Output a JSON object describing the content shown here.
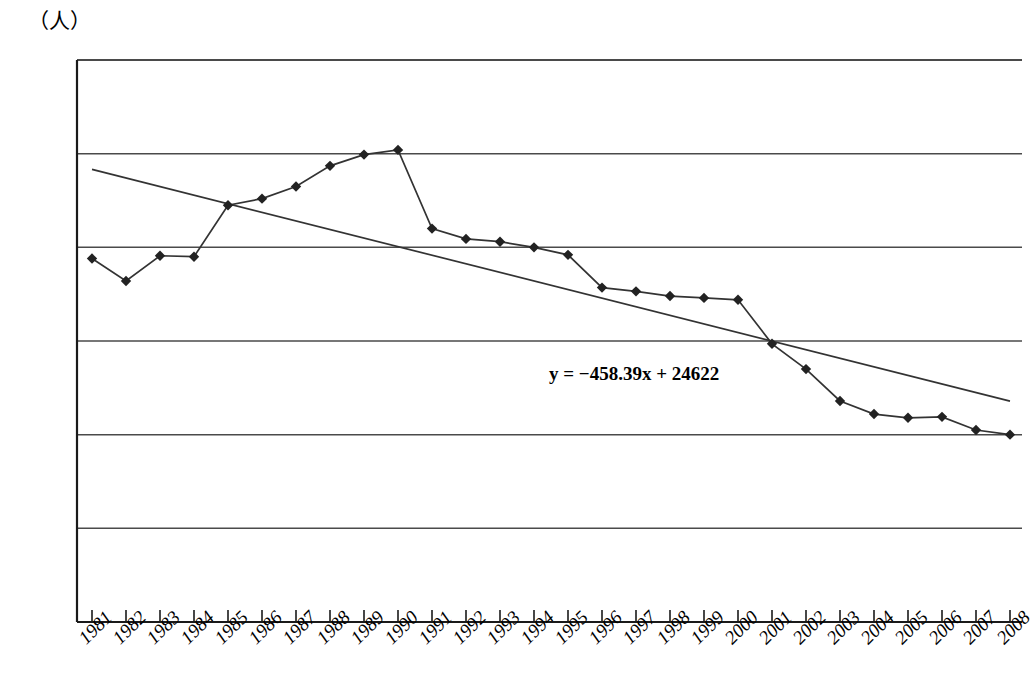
{
  "chart_data": {
    "type": "line",
    "title": "",
    "subtitle": "",
    "xlabel": "",
    "ylabel": "（人）",
    "unit_label": "（人）",
    "grid": true,
    "legend": "none",
    "xlim": [
      1981,
      2008
    ],
    "ylim": [
      0,
      30000
    ],
    "ytick_labels": [
      "30000",
      "25000",
      "20000",
      "15000",
      "10000",
      "5000",
      "0"
    ],
    "ytick_values": [
      30000,
      25000,
      20000,
      15000,
      10000,
      5000,
      0
    ],
    "categories": [
      "1981",
      "1982",
      "1983",
      "1984",
      "1985",
      "1986",
      "1987",
      "1988",
      "1989",
      "1990",
      "1991",
      "1992",
      "1993",
      "1994",
      "1995",
      "1996",
      "1997",
      "1998",
      "1999",
      "2000",
      "2001",
      "2002",
      "2003",
      "2004",
      "2005",
      "2006",
      "2007",
      "2008"
    ],
    "values": [
      19400,
      18200,
      19550,
      19500,
      22250,
      22600,
      23250,
      24350,
      24950,
      25200,
      21000,
      20450,
      20300,
      20000,
      19600,
      17850,
      17650,
      17400,
      17300,
      17200,
      14850,
      13500,
      11800,
      11100,
      10900,
      10950,
      10250,
      10000
    ],
    "series": [
      {
        "name": "data",
        "marker": "diamond",
        "values": [
          19400,
          18200,
          19550,
          19500,
          22250,
          22600,
          23250,
          24350,
          24950,
          25200,
          21000,
          20450,
          20300,
          20000,
          19600,
          17850,
          17650,
          17400,
          17300,
          17200,
          14850,
          13500,
          11800,
          11100,
          10900,
          10950,
          10250,
          10000
        ]
      },
      {
        "name": "trendline",
        "type": "linear-fit",
        "equation": "y = −458.39x + 24622",
        "slope": -458.39,
        "intercept": 24622,
        "endpoints": [
          24164,
          11787
        ]
      }
    ],
    "annotations": [
      {
        "text": "y = −458.39x + 24622",
        "x": 2001,
        "y": 13500
      }
    ]
  },
  "colors": {
    "axis": "#1a1a1a",
    "grid": "#4a4a4a",
    "series": "#222222",
    "trend": "#333333",
    "background": "#ffffff"
  }
}
